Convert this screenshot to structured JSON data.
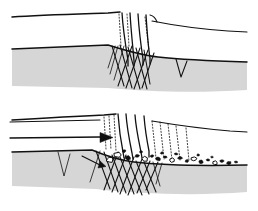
{
  "figure": {
    "title": "Graben and conjugate fracture development cross-section",
    "type": "geological-cross-section",
    "panel_count": 2,
    "background_color": "#ffffff",
    "ink_color": "#111111",
    "rock_fill_color": "#d6d6d6",
    "clast_color": "#101010"
  },
  "panels": [
    {
      "id": "upper-panel",
      "label": "Stage 1 - initial fracturing",
      "stage_number": "1",
      "surface_description": "gently undulating ground surface with narrow open fissures",
      "features": [
        "open vertical fissures",
        "conjugate shear fractures",
        "competent gray layer",
        "small v-notch fracture"
      ],
      "fissure_count": 3,
      "arrow_present": false,
      "clast_count": 0
    },
    {
      "id": "lower-panel",
      "label": "Stage 2 - extension and brecciation",
      "stage_number": "2",
      "surface_description": "subsided ground surface with widened fissures and scattered angular breccia",
      "features": [
        "widened open fissures",
        "conjugate shear fractures",
        "dilated dotted fractures",
        "angular breccia clasts",
        "transport direction arrow"
      ],
      "fissure_count": 3,
      "arrow_present": true,
      "arrow_label": "transport direction",
      "arrow_direction": "right",
      "clast_count": 24
    }
  ],
  "geometry": {
    "upper": {
      "ground_surface": "M12,17 C40,15 78,14 108,13 L120,12",
      "ground_surface_right": "M152,21 C172,25 200,29 228,31 L247,32",
      "fissures": [
        "M122,13 C123,30 126,48 128,60 L128,66",
        "M130,13 C131,31 133,48 134,61 L134,66",
        "M138,14 C139,30 141,46 143,59 L143,65",
        "M146,15 C147,30 148,46 150,58 L150,64"
      ],
      "rock_top": "M12,49 L108,45 C124,50 140,55 158,57 C186,60 216,61 247,62",
      "rock_bottom": "M12,86 L108,88 C150,92 200,93 247,90",
      "faults": [
        "M112,46 L124,86",
        "M120,45 L132,88",
        "M128,47 L140,89",
        "M136,48 L147,89",
        "M144,50 L150,84",
        "M132,46 L118,86",
        "M140,48 L126,88",
        "M148,50 L134,89",
        "M154,53 L142,88",
        "M118,46 L110,74",
        "M124,46 L114,80"
      ],
      "notch": "M176,59 L181,77 L187,61",
      "dotlines": [
        "M119,14 L121,46",
        "M127,14 L129,46",
        "M145,17 L149,50"
      ]
    },
    "lower": {
      "ground_surface": "M12,120 C44,118 80,116 104,115 L116,114",
      "ground_surface_right": "M152,121 C176,125 206,129 230,131 L247,132",
      "fissures": [
        "M118,114 C119,128 121,142 123,152 L124,158",
        "M126,114 C127,129 130,143 132,153 L133,159",
        "M135,115 C136,129 139,142 141,152 L142,158",
        "M144,116 C145,129 147,141 149,151 L149,157"
      ],
      "arrow_shaft": "M10,138 L100,137",
      "arrow_head": "M100,133 L112,137.5 L100,142 Z",
      "upper_line": "M10,122 L100,120",
      "rock_top": "M12,152 L92,150 C104,155 118,160 134,162 C160,165 200,166 247,165",
      "rock_bottom": "M12,186 L96,189 C140,194 196,196 247,192",
      "faults": [
        "M96,151 L110,189",
        "M104,152 L118,192",
        "M112,155 L126,193",
        "M120,157 L134,194",
        "M128,159 L142,195",
        "M136,161 L149,194",
        "M144,162 L156,192",
        "M118,152 L104,190",
        "M126,155 L112,192",
        "M134,157 L120,194",
        "M142,159 L128,195",
        "M150,161 L137,193",
        "M158,162 L146,190",
        "M100,151 L90,182"
      ],
      "notch": "M58,152 L64,176 L70,154",
      "dotlines": [
        "M112,116 L114,150",
        "M108,118 L110,148",
        "M156,122 L160,160",
        "M164,124 L168,160",
        "M172,126 L176,160",
        "M148,120 L152,156"
      ],
      "small_arrow": "M84,158 L100,166"
    }
  },
  "clasts": [
    {
      "cx": 118,
      "cy": 155,
      "rx": 4.5,
      "ry": 3.2,
      "filled": false
    },
    {
      "cx": 128,
      "cy": 158,
      "rx": 3.0,
      "ry": 2.2,
      "filled": true
    },
    {
      "cx": 137,
      "cy": 156,
      "rx": 2.4,
      "ry": 1.8,
      "filled": true
    },
    {
      "cx": 145,
      "cy": 159,
      "rx": 3.6,
      "ry": 2.6,
      "filled": false
    },
    {
      "cx": 152,
      "cy": 156,
      "rx": 2.0,
      "ry": 1.5,
      "filled": true
    },
    {
      "cx": 158,
      "cy": 159,
      "rx": 2.8,
      "ry": 2.0,
      "filled": true
    },
    {
      "cx": 165,
      "cy": 157,
      "rx": 2.2,
      "ry": 1.6,
      "filled": true
    },
    {
      "cx": 172,
      "cy": 160,
      "rx": 3.0,
      "ry": 2.2,
      "filled": false
    },
    {
      "cx": 180,
      "cy": 158,
      "rx": 2.4,
      "ry": 1.7,
      "filled": true
    },
    {
      "cx": 187,
      "cy": 161,
      "rx": 2.0,
      "ry": 1.5,
      "filled": true
    },
    {
      "cx": 194,
      "cy": 159,
      "rx": 3.2,
      "ry": 2.3,
      "filled": false
    },
    {
      "cx": 201,
      "cy": 162,
      "rx": 2.6,
      "ry": 1.9,
      "filled": true
    },
    {
      "cx": 208,
      "cy": 160,
      "rx": 2.0,
      "ry": 1.5,
      "filled": true
    },
    {
      "cx": 215,
      "cy": 163,
      "rx": 3.0,
      "ry": 2.1,
      "filled": false
    },
    {
      "cx": 222,
      "cy": 161,
      "rx": 2.2,
      "ry": 1.6,
      "filled": true
    },
    {
      "cx": 229,
      "cy": 163,
      "rx": 2.6,
      "ry": 1.8,
      "filled": true
    },
    {
      "cx": 236,
      "cy": 162,
      "rx": 1.8,
      "ry": 1.3,
      "filled": true
    },
    {
      "cx": 124,
      "cy": 151,
      "rx": 2.0,
      "ry": 1.5,
      "filled": true
    },
    {
      "cx": 141,
      "cy": 152,
      "rx": 1.8,
      "ry": 1.4,
      "filled": true
    },
    {
      "cx": 162,
      "cy": 153,
      "rx": 1.6,
      "ry": 1.2,
      "filled": true
    },
    {
      "cx": 176,
      "cy": 154,
      "rx": 1.8,
      "ry": 1.3,
      "filled": true
    },
    {
      "cx": 198,
      "cy": 155,
      "rx": 1.6,
      "ry": 1.2,
      "filled": true
    },
    {
      "cx": 212,
      "cy": 157,
      "rx": 1.5,
      "ry": 1.1,
      "filled": true
    },
    {
      "cx": 110,
      "cy": 160,
      "rx": 3.8,
      "ry": 2.8,
      "filled": false
    }
  ]
}
